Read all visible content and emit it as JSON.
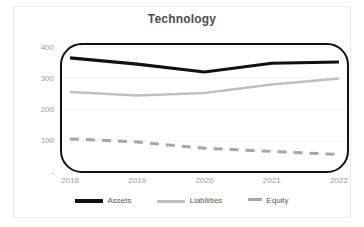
{
  "chart_data": {
    "type": "line",
    "title": "Technology",
    "xlabel": "",
    "ylabel": "",
    "x": [
      "2018",
      "2019",
      "2020",
      "2021",
      "2022"
    ],
    "categories": [
      "2018",
      "2019",
      "2020",
      "2021",
      "2022"
    ],
    "ylim": [
      0,
      400
    ],
    "yticks": [
      "-",
      "100",
      "200",
      "300",
      "400"
    ],
    "ytick_values": [
      0,
      100,
      200,
      300,
      400
    ],
    "grid": true,
    "legend_position": "bottom",
    "series": [
      {
        "name": "Assets",
        "values": [
          365,
          345,
          320,
          348,
          352
        ],
        "color": "#111111",
        "style": "solid",
        "width": 3.2
      },
      {
        "name": "Liabilities",
        "values": [
          256,
          245,
          253,
          280,
          299
        ],
        "color": "#bfbfbf",
        "style": "solid",
        "width": 2.6
      },
      {
        "name": "Equity",
        "values": [
          106,
          96,
          76,
          66,
          56
        ],
        "color": "#a6a6a6",
        "style": "dashed",
        "width": 3.0
      }
    ]
  },
  "legend": {
    "items": [
      {
        "label": "Assets"
      },
      {
        "label": "Liabilities"
      },
      {
        "label": "Equity"
      }
    ]
  },
  "colors": {
    "assets": "#111111",
    "liabilities": "#bfbfbf",
    "equity": "#a6a6a6",
    "title": "#4d4d4d",
    "tick": "#9a9a9a",
    "plot_border": "#111111",
    "background": "#ffffff"
  }
}
